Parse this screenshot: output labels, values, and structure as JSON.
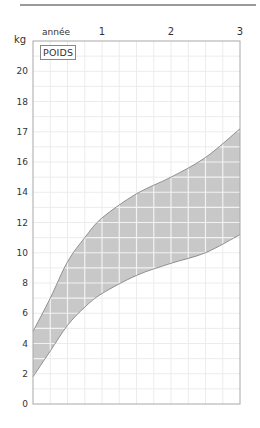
{
  "chart_data": {
    "type": "area",
    "title": "POIDS",
    "xlabel": "année",
    "ylabel": "kg",
    "x_ticks": [
      "1",
      "2",
      "3"
    ],
    "y_ticks": [
      "20",
      "18",
      "17",
      "16",
      "14",
      "12",
      "10",
      "8",
      "6",
      "4",
      "2",
      "0"
    ],
    "xlim": [
      0,
      3
    ],
    "ylim": [
      0,
      24
    ],
    "grid": true,
    "legend": null,
    "series": [
      {
        "name": "upper bound",
        "x": [
          0,
          0.25,
          0.5,
          0.75,
          1.0,
          1.5,
          2.0,
          2.5,
          3.0
        ],
        "values": [
          4.8,
          7.0,
          9.4,
          11.0,
          12.3,
          13.9,
          15.0,
          16.3,
          18.2
        ]
      },
      {
        "name": "lower bound",
        "x": [
          0,
          0.25,
          0.5,
          0.75,
          1.0,
          1.5,
          2.0,
          2.5,
          3.0
        ],
        "values": [
          1.8,
          3.5,
          5.2,
          6.4,
          7.3,
          8.5,
          9.3,
          10.0,
          11.2
        ]
      }
    ],
    "colors": {
      "band_fill": "#c8c8c8",
      "band_stroke": "#7a7a7a",
      "grid": "#ececec",
      "axis": "#a0a0a0"
    }
  },
  "header": {
    "unit_label": "kg",
    "x_unit_label": "année",
    "title_label": "POIDS"
  }
}
